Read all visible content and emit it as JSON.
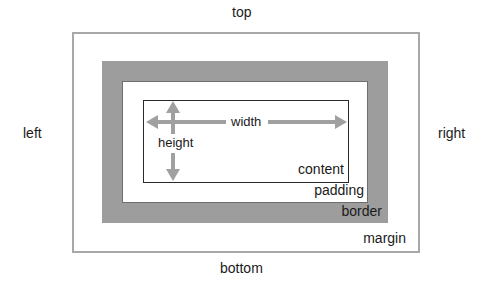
{
  "diagram": {
    "sides": {
      "top": "top",
      "bottom": "bottom",
      "left": "left",
      "right": "right"
    },
    "layers": {
      "content": "content",
      "padding": "padding",
      "border": "border",
      "margin": "margin"
    },
    "dimensions": {
      "width": "width",
      "height": "height"
    },
    "colors": {
      "margin_outline": "#a8a8a8",
      "border_fill": "#9d9d9d",
      "content_outline": "#2a2a2a",
      "arrow": "#a0a0a0",
      "text": "#1a1a1a"
    }
  }
}
